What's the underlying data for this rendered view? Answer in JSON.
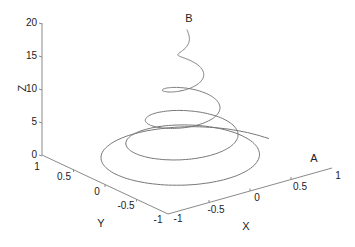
{
  "chart_data": {
    "type": "line3d",
    "title": "",
    "xlabel": "X",
    "ylabel": "Y",
    "zlabel": "Z",
    "xlim": [
      -1,
      1
    ],
    "ylim": [
      -1,
      1
    ],
    "zlim": [
      0,
      20
    ],
    "grid": false,
    "x_ticks": [
      "-1",
      "-0.5",
      "0",
      "0.5",
      "1"
    ],
    "y_ticks": [
      "1",
      "0.5",
      "0",
      "-0.5",
      "-1"
    ],
    "z_ticks": [
      "0",
      "5",
      "10",
      "15",
      "20"
    ],
    "annotations": [
      {
        "text": "A",
        "note": "curve start (near X=1, low Z)"
      },
      {
        "text": "B",
        "note": "curve end (top, Z=20)"
      }
    ],
    "series": [
      {
        "name": "conical spiral",
        "description": "Helix with radius shrinking from ~1 to 0 as Z rises from 0 to 20; starts at point A, ends at point B",
        "z_range": [
          0,
          20
        ],
        "radius_range": [
          1,
          0
        ],
        "turns": 5
      }
    ]
  },
  "labels": {
    "x": "X",
    "y": "Y",
    "z": "Z",
    "a": "A",
    "b": "B"
  },
  "ticks": {
    "z": [
      "0",
      "5",
      "10",
      "15",
      "20"
    ],
    "y": [
      "1",
      "0.5",
      "0",
      "-0.5",
      "-1"
    ],
    "x": [
      "-1",
      "-0.5",
      "0",
      "0.5",
      "1"
    ]
  }
}
